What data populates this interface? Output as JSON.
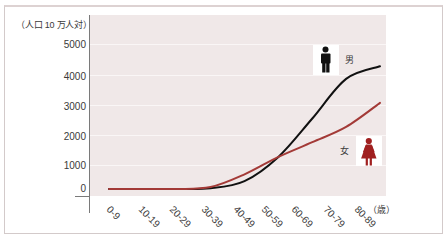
{
  "chart_data": {
    "type": "line",
    "title": "",
    "ylabel": "（人口 10 万人対）",
    "xlabel": "（歳）",
    "categories": [
      "0-9",
      "10-19",
      "20-29",
      "30-39",
      "40-49",
      "50-59",
      "60-69",
      "70-79",
      "80-89"
    ],
    "yticks": [
      0,
      1000,
      2000,
      3000,
      4000,
      5000
    ],
    "ylim": [
      0,
      5000
    ],
    "grid": true,
    "legend": {
      "position": "inline-right"
    },
    "series": [
      {
        "name": "男",
        "icon": "male-icon",
        "color": "#111111",
        "values": [
          0,
          0,
          0,
          30,
          330,
          1270,
          2550,
          3870,
          4280
        ]
      },
      {
        "name": "女",
        "icon": "female-icon",
        "color": "#a33a37",
        "values": [
          0,
          0,
          0,
          80,
          610,
          1270,
          1760,
          2270,
          3070
        ]
      }
    ]
  },
  "colors": {
    "plot_background": "#f0e8e8",
    "male": "#111111",
    "female": "#a33a37",
    "female_icon": "#a01f1f"
  }
}
